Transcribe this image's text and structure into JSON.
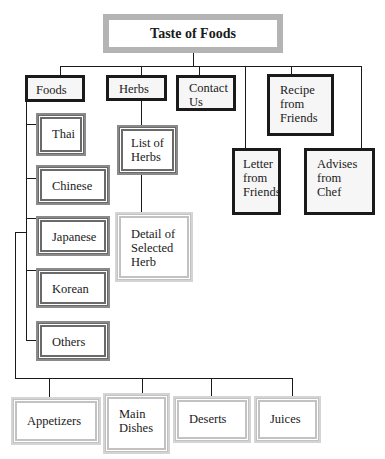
{
  "diagram": {
    "title": "Taste of Foods",
    "top_level": [
      {
        "id": "foods",
        "label": "Foods"
      },
      {
        "id": "herbs",
        "label": "Herbs"
      },
      {
        "id": "contact",
        "label": "Contact\nUs"
      },
      {
        "id": "recipe",
        "label": "Recipe\nfrom\nFriends"
      },
      {
        "id": "letter",
        "label": "Letter\nfrom\nFriends"
      },
      {
        "id": "advises",
        "label": "Advises\nfrom\nChef"
      }
    ],
    "foods_children": [
      {
        "label": "Thai"
      },
      {
        "label": "Chinese"
      },
      {
        "label": "Japanese"
      },
      {
        "label": "Korean"
      },
      {
        "label": "Others"
      }
    ],
    "herbs_children": [
      {
        "label": "List of\nHerbs"
      },
      {
        "label": "Detail of\nSelected\nHerb"
      }
    ],
    "course_categories": [
      {
        "label": "Appetizers"
      },
      {
        "label": "Main\nDishes"
      },
      {
        "label": "Deserts"
      },
      {
        "label": "Juices"
      }
    ],
    "colors": {
      "title_border": "#b4b4b4",
      "primary_border": "#1a1a1a",
      "secondary_border": "#6a6a6a",
      "tertiary_border": "#c2c2c2"
    }
  }
}
